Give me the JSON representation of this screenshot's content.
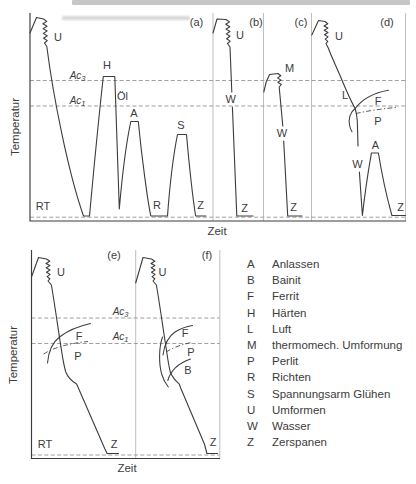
{
  "style": {
    "ink_color": "#3c3c3c",
    "dashed_line_color": "#878787",
    "separator_color": "#a2a2a2",
    "background": "#ffffff"
  },
  "figure_top": {
    "panels": {
      "a": "(a)",
      "b": "(b)",
      "c": "(c)",
      "d": "(d)"
    },
    "axis": {
      "y": "Temperatur",
      "x": "Zeit",
      "rt": "RT",
      "ac3_base": "Ac",
      "ac3_sub": "3",
      "ac1_base": "Ac",
      "ac1_sub": "1"
    },
    "labels": {
      "a_u": "U",
      "a_h": "H",
      "a_oel": "Öl",
      "a_a": "A",
      "a_r": "R",
      "a_s": "S",
      "a_z": "Z",
      "b_u": "U",
      "b_w": "W",
      "b_z": "Z",
      "c_m": "M",
      "c_w": "W",
      "c_z": "Z",
      "d_u": "U",
      "d_l": "L",
      "d_f": "F",
      "d_p": "P",
      "d_w": "W",
      "d_a": "A",
      "d_z": "Z"
    }
  },
  "figure_bottom": {
    "panels": {
      "e": "(e)",
      "f": "(f)"
    },
    "axis": {
      "y": "Temperatur",
      "x": "Zeit",
      "rt": "RT",
      "ac3_base": "Ac",
      "ac3_sub": "3",
      "ac1_base": "Ac",
      "ac1_sub": "1"
    },
    "labels": {
      "e_u": "U",
      "e_f": "F",
      "e_p": "P",
      "e_z": "Z",
      "f_u": "U",
      "f_f": "F",
      "f_p": "P",
      "f_b": "B",
      "f_z": "Z"
    }
  },
  "legend": {
    "items": [
      {
        "key": "A",
        "label": "Anlassen"
      },
      {
        "key": "B",
        "label": "Bainit"
      },
      {
        "key": "F",
        "label": "Ferrit"
      },
      {
        "key": "H",
        "label": "Härten"
      },
      {
        "key": "L",
        "label": "Luft"
      },
      {
        "key": "M",
        "label": "thermomech. Umformung"
      },
      {
        "key": "P",
        "label": "Perlit"
      },
      {
        "key": "R",
        "label": "Richten"
      },
      {
        "key": "S",
        "label": "Spannungsarm Glühen"
      },
      {
        "key": "U",
        "label": "Umformen"
      },
      {
        "key": "W",
        "label": "Wasser"
      },
      {
        "key": "Z",
        "label": "Zerspanen"
      }
    ]
  }
}
